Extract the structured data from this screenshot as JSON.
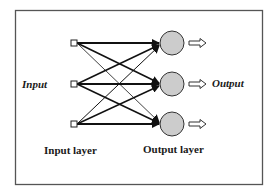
{
  "diagram": {
    "labels": {
      "input_side": "Input",
      "output_side": "Output",
      "input_layer": "Input layer",
      "output_layer": "Output layer"
    },
    "input_nodes": [
      {
        "id": "i1",
        "shape": "square"
      },
      {
        "id": "i2",
        "shape": "square"
      },
      {
        "id": "i3",
        "shape": "square"
      }
    ],
    "output_nodes": [
      {
        "id": "o1",
        "shape": "circle"
      },
      {
        "id": "o2",
        "shape": "circle"
      },
      {
        "id": "o3",
        "shape": "circle"
      }
    ],
    "connections": "fully-connected (each input node to each output node, arrow into output)",
    "output_arrows": 3,
    "colors": {
      "border": "#555555",
      "line": "#111111",
      "output_node_fill": "#cccccc",
      "output_node_stroke": "#333333",
      "input_node_fill": "#ffffff"
    }
  }
}
